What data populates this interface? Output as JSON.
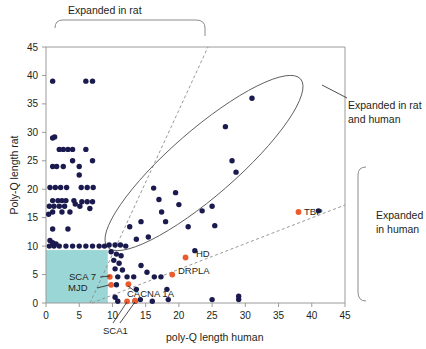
{
  "chart_data": {
    "type": "scatter",
    "title": "",
    "xlabel": "poly-Q length human",
    "ylabel": "Poly-Q length rat",
    "xlim": [
      0,
      45
    ],
    "ylim": [
      0,
      45
    ],
    "xticks": [
      0,
      5,
      10,
      15,
      20,
      25,
      30,
      35,
      40,
      45
    ],
    "yticks": [
      0,
      5,
      10,
      15,
      20,
      25,
      30,
      35,
      40,
      45
    ],
    "grid": false,
    "legend_position": "none",
    "series": [
      {
        "name": "genes",
        "color": "#1a1a4e",
        "marker": "circle",
        "points": [
          [
            1,
            39
          ],
          [
            6,
            39
          ],
          [
            7,
            39
          ],
          [
            1,
            29
          ],
          [
            1.3,
            29.2
          ],
          [
            2,
            27
          ],
          [
            2.6,
            27
          ],
          [
            3.3,
            27
          ],
          [
            4,
            27
          ],
          [
            6,
            27
          ],
          [
            1,
            24
          ],
          [
            1.6,
            24
          ],
          [
            2.6,
            24
          ],
          [
            4,
            25
          ],
          [
            5,
            24
          ],
          [
            7,
            25
          ],
          [
            5,
            22.5
          ],
          [
            0.6,
            20.3
          ],
          [
            1.4,
            20.3
          ],
          [
            2.2,
            20.3
          ],
          [
            3.1,
            20.3
          ],
          [
            5.3,
            20.3
          ],
          [
            6.2,
            20.3
          ],
          [
            7.1,
            20.3
          ],
          [
            1,
            18
          ],
          [
            1.8,
            18
          ],
          [
            2.4,
            18
          ],
          [
            3,
            18
          ],
          [
            4.2,
            18
          ],
          [
            5.4,
            17.8
          ],
          [
            6.2,
            17.8
          ],
          [
            7,
            17.8
          ],
          [
            0.5,
            17
          ],
          [
            1.2,
            17
          ],
          [
            2,
            17
          ],
          [
            2.8,
            17
          ],
          [
            0.4,
            15.6
          ],
          [
            1,
            16
          ],
          [
            2.4,
            16
          ],
          [
            3.6,
            16
          ],
          [
            4.4,
            17.4
          ],
          [
            5.1,
            17
          ],
          [
            6.6,
            16.6
          ],
          [
            1,
            13
          ],
          [
            3.3,
            13
          ],
          [
            0.6,
            11
          ],
          [
            1,
            10.6
          ],
          [
            1.5,
            10.4
          ],
          [
            0.5,
            10
          ],
          [
            1.2,
            10
          ],
          [
            2,
            10
          ],
          [
            3,
            10
          ],
          [
            4,
            10
          ],
          [
            5,
            10
          ],
          [
            6,
            10
          ],
          [
            7,
            10
          ],
          [
            8,
            10
          ],
          [
            8.8,
            10
          ],
          [
            9.5,
            10.2
          ],
          [
            10.4,
            10.2
          ],
          [
            11.2,
            10.2
          ],
          [
            12,
            10
          ],
          [
            9.8,
            9
          ],
          [
            10.6,
            8.6
          ],
          [
            11.3,
            8.3
          ],
          [
            10.2,
            7.5
          ],
          [
            11,
            7
          ],
          [
            10.4,
            6
          ],
          [
            11.5,
            5.8
          ],
          [
            10.8,
            4.6
          ],
          [
            12.2,
            4.6
          ],
          [
            13.2,
            4.6
          ],
          [
            10.6,
            3.2
          ],
          [
            13.6,
            2.4
          ],
          [
            10.4,
            1
          ],
          [
            10.8,
            0.3
          ],
          [
            13.4,
            0.3
          ],
          [
            14.2,
            0.6
          ],
          [
            16,
            0.3
          ],
          [
            12.6,
            13.4
          ],
          [
            13.6,
            11.2
          ],
          [
            14.3,
            14.3
          ],
          [
            15.4,
            11.6
          ],
          [
            16.2,
            20.2
          ],
          [
            17,
            18.2
          ],
          [
            17.4,
            16
          ],
          [
            18,
            14.3
          ],
          [
            19.5,
            19.4
          ],
          [
            20,
            17.3
          ],
          [
            21.4,
            13.4
          ],
          [
            22.4,
            9.2
          ],
          [
            23.5,
            16.2
          ],
          [
            25,
            17
          ],
          [
            25.4,
            13.6
          ],
          [
            27,
            31
          ],
          [
            28,
            25
          ],
          [
            28.6,
            23
          ],
          [
            31,
            36
          ],
          [
            18.4,
            0.6
          ],
          [
            25,
            0.6
          ],
          [
            29,
            0.6
          ],
          [
            29,
            1.2
          ],
          [
            41,
            16.2
          ],
          [
            14.3,
            6.6
          ],
          [
            15.2,
            5.4
          ],
          [
            16.3,
            4.6
          ],
          [
            17.3,
            4.6
          ],
          [
            18.2,
            2.4
          ]
        ]
      },
      {
        "name": "disease-genes",
        "color": "#ea5b2d",
        "marker": "circle",
        "points": [
          {
            "x": 21,
            "y": 8,
            "label": "HD"
          },
          {
            "x": 19,
            "y": 5,
            "label": "DRPLA"
          },
          {
            "x": 38,
            "y": 16,
            "label": "TBP"
          },
          {
            "x": 9.6,
            "y": 4.6,
            "label": "SCA 7"
          },
          {
            "x": 9.8,
            "y": 3.2,
            "label": "MJD"
          },
          {
            "x": 12.4,
            "y": 3.3,
            "label": "CACNA 1A"
          },
          {
            "x": 12.2,
            "y": 0.3,
            "label": "SCA1"
          },
          {
            "x": 13.4,
            "y": 0.4,
            "label": ""
          }
        ]
      }
    ],
    "annotations": [
      {
        "name": "expanded-in-rat",
        "text": "Expanded in rat"
      },
      {
        "name": "expanded-in-rat-and-human",
        "text": "Expanded in rat\nand human"
      },
      {
        "name": "expanded-in-human",
        "text": "Expanded\nin human"
      }
    ],
    "colors": {
      "rat_point": "#1a1a4e",
      "disease_point": "#ea5b2d",
      "shaded_box": "#9ad6d6",
      "axis": "#9a9a9a",
      "outline": "#5a5a5a"
    },
    "shaded_region": {
      "x0": 0,
      "x1": 9.3,
      "y0": 0,
      "y1": 9.3
    }
  },
  "labels": {
    "ylabel": "Poly-Q length rat",
    "xlabel": "poly-Q length human",
    "anno_top": "Expanded in rat",
    "anno_right_1": "Expanded in rat",
    "anno_right_2": "and human",
    "anno_human_1": "Expanded",
    "anno_human_2": "in human",
    "hd": "HD",
    "drpla": "DRPLA",
    "tbp": "TBP",
    "sca7": "SCA 7",
    "mjd": "MJD",
    "cacna1a": "CACNA 1A",
    "sca1": "SCA1"
  },
  "ticks": {
    "x": [
      "0",
      "5",
      "10",
      "15",
      "20",
      "25",
      "30",
      "35",
      "40",
      "45"
    ],
    "y": [
      "0",
      "5",
      "10",
      "15",
      "20",
      "25",
      "30",
      "35",
      "40",
      "45"
    ]
  }
}
